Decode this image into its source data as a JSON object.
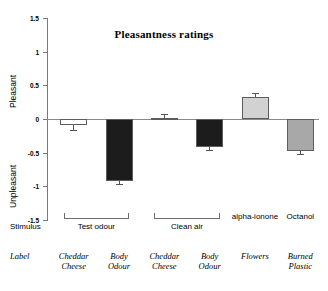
{
  "chart_data": {
    "type": "bar",
    "title": "Pleasantness ratings",
    "xlabel": "",
    "ylabel": "",
    "ylim": [
      -1.5,
      1.5
    ],
    "yticks": [
      "1.5",
      "1",
      "0.5",
      "0",
      "-0.5",
      "-1",
      "-1.5"
    ],
    "ytick_values": [
      1.5,
      1,
      0.5,
      0,
      -0.5,
      -1,
      -1.5
    ],
    "grid": false,
    "legend": "none",
    "axis_word_top": "Pleasant",
    "axis_word_bottom": "Unpleasant",
    "categories": [
      "Cheddar Cheese",
      "Body Odour",
      "Cheddar Cheese",
      "Body Odour",
      "Flowers",
      "Burned Plastic"
    ],
    "values": [
      -0.09,
      -0.92,
      0.02,
      -0.42,
      0.33,
      -0.47
    ],
    "errors": [
      0.07,
      0.05,
      0.05,
      0.04,
      0.05,
      0.05
    ],
    "bar_colors": [
      "#ffffff",
      "#1c1c1c",
      "#9a9a9a",
      "#1c1c1c",
      "#d2d2d2",
      "#a8a8a8"
    ],
    "bar_edge": "#5d5d5d",
    "rows": {
      "stimulus_key": "Stimulus",
      "label_key": "Label",
      "stimulus_groups": [
        {
          "name": "Test odour",
          "bracket": true,
          "start": 0,
          "end": 1
        },
        {
          "name": "Clean air",
          "bracket": true,
          "start": 2,
          "end": 3
        },
        {
          "name": "alpha-ionone",
          "bracket": false,
          "start": 4,
          "end": 4
        },
        {
          "name": "Octanol",
          "bracket": false,
          "start": 5,
          "end": 5
        }
      ],
      "labels": [
        [
          "Cheddar",
          "Cheese"
        ],
        [
          "Body",
          "Odour"
        ],
        [
          "Cheddar",
          "Cheese"
        ],
        [
          "Body",
          "Odour"
        ],
        [
          "Flowers",
          ""
        ],
        [
          "Burned",
          "Plastic"
        ]
      ]
    }
  }
}
